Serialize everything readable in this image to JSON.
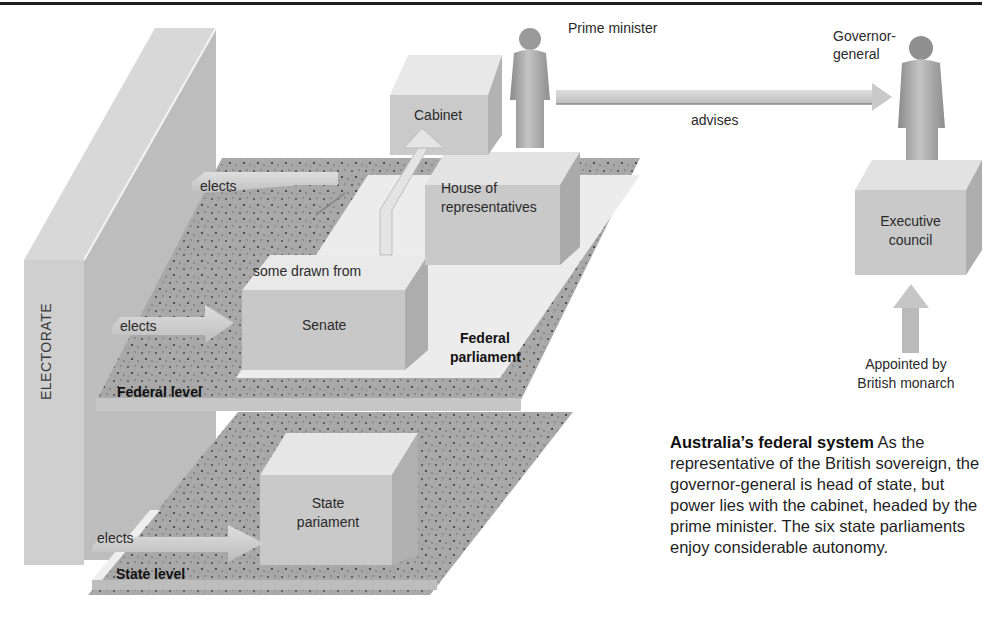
{
  "diagram": {
    "electorate_label": "ELECTORATE",
    "levels": {
      "federal": "Federal level",
      "state": "State level"
    },
    "bodies": {
      "cabinet": "Cabinet",
      "house_line1": "House of",
      "house_line2": "representatives",
      "senate": "Senate",
      "federal_parliament_line1": "Federal",
      "federal_parliament_line2": "parliament",
      "state_parliament_line1": "State",
      "state_parliament_line2": "pariament",
      "executive_line1": "Executive",
      "executive_line2": "council"
    },
    "people": {
      "prime_minister": "Prime minister",
      "governor_line1": "Governor-",
      "governor_line2": "general"
    },
    "arrows": {
      "elects_house": "elects",
      "elects_senate": "elects",
      "elects_state": "elects",
      "some_drawn_from": "some drawn from",
      "advises": "advises",
      "appointed_line1": "Appointed by",
      "appointed_line2": "British monarch"
    },
    "caption": {
      "title": "Australia’s federal system",
      "body": " As the representative of the British sovereign, the governor-general is head of state, but power lies with the cabinet, headed by the prime minister. The six state parliaments enjoy considerable autonomy."
    },
    "colors": {
      "wall_front": "#d2d2d2",
      "wall_side": "#b5b5b5",
      "speckle": "#a9a9a9",
      "platform": "#ececec",
      "box_front": "#c9c9c9",
      "box_side": "#b0b0b0",
      "figure": "#9c9c9c",
      "rule": "#1e1e1e"
    }
  }
}
